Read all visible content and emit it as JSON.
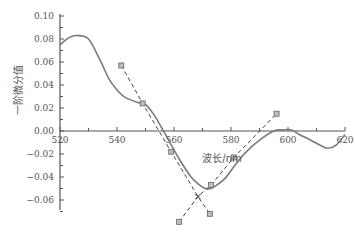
{
  "chart_data": {
    "type": "line",
    "title": "",
    "xlabel": "波长/nm",
    "ylabel": "一阶微分值",
    "xlim": [
      520,
      620
    ],
    "ylim": [
      -0.07,
      0.1
    ],
    "x_ticks": [
      520,
      540,
      560,
      580,
      600,
      620
    ],
    "x_tick_labels": [
      "520",
      "540",
      "560",
      "580",
      "600",
      "620"
    ],
    "y_ticks": [
      0.1,
      0.08,
      0.06,
      0.04,
      0.02,
      0.0,
      -0.02,
      -0.04,
      -0.06
    ],
    "y_tick_labels": [
      "0.10",
      "0.08",
      "0.06",
      "0.04",
      "0.02",
      "0.00",
      "−0.02",
      "−0.04",
      "−0.06"
    ],
    "grid": false,
    "legend": "none",
    "series": [
      {
        "name": "first-derivative-curve",
        "style": "solid",
        "color": "#7a7a7a",
        "x": [
          520,
          523,
          526,
          530,
          534,
          537.5,
          541,
          543,
          547,
          550,
          553,
          557,
          562,
          566,
          569,
          571,
          573,
          575,
          578,
          581,
          585,
          590,
          595,
          598,
          601,
          604,
          608,
          611,
          614,
          617,
          620
        ],
        "y": [
          0.075,
          0.081,
          0.083,
          0.08,
          0.062,
          0.044,
          0.033,
          0.029,
          0.025,
          0.023,
          0.014,
          -0.003,
          -0.025,
          -0.04,
          -0.047,
          -0.05,
          -0.05,
          -0.047,
          -0.041,
          -0.031,
          -0.019,
          -0.008,
          0.0,
          0.001,
          0.001,
          -0.003,
          -0.008,
          -0.012,
          -0.015,
          -0.012,
          -0.003
        ]
      },
      {
        "name": "tangent-line-left",
        "style": "dashed",
        "color": "#444444",
        "x": [
          541.5,
          549,
          559,
          568.4,
          572.6
        ],
        "y": [
          0.057,
          0.024,
          -0.018,
          -0.057,
          -0.072
        ]
      },
      {
        "name": "tangent-line-right",
        "style": "dashed",
        "color": "#444444",
        "x": [
          561.8,
          568.4,
          573,
          581,
          596
        ],
        "y": [
          -0.079,
          -0.057,
          -0.047,
          -0.023,
          0.015
        ]
      }
    ],
    "markers": [
      {
        "x": 541.5,
        "y": 0.057
      },
      {
        "x": 549,
        "y": 0.024
      },
      {
        "x": 559,
        "y": -0.018
      },
      {
        "x": 572.6,
        "y": -0.072
      },
      {
        "x": 561.8,
        "y": -0.079
      },
      {
        "x": 573,
        "y": -0.047
      },
      {
        "x": 581,
        "y": -0.023
      },
      {
        "x": 596,
        "y": 0.015
      }
    ],
    "intersection": {
      "x": 568.4,
      "y": -0.057,
      "symbol": "x"
    }
  },
  "colors": {
    "axis": "#555555",
    "curve": "#7a7a7a",
    "dash": "#444444",
    "marker_fill": "#bdbdbd",
    "marker_stroke": "#666666"
  }
}
